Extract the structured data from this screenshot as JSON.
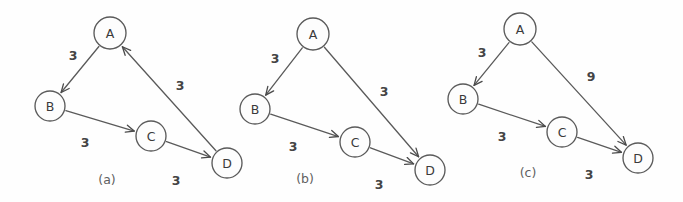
{
  "figure": {
    "width": 683,
    "height": 202,
    "background_color": "#fefefe",
    "stroke_color": "#5a5a5a",
    "text_color": "#3a3a3a"
  },
  "chart_data": {
    "type": "diagram",
    "title": "",
    "panels": [
      {
        "caption": "(a)",
        "caption_x": 107,
        "caption_y": 179,
        "nodes": [
          {
            "id": "A",
            "label": "A",
            "x": 110,
            "y": 33,
            "r": 16
          },
          {
            "id": "B",
            "label": "B",
            "x": 50,
            "y": 106,
            "r": 15
          },
          {
            "id": "C",
            "label": "C",
            "x": 151,
            "y": 136,
            "r": 15
          },
          {
            "id": "D",
            "label": "D",
            "x": 227,
            "y": 163,
            "r": 15
          }
        ],
        "edges": [
          {
            "from": "A",
            "to": "B",
            "weight": "3",
            "label_x": 73,
            "label_y": 55
          },
          {
            "from": "D",
            "to": "A",
            "weight": "3",
            "label_x": 180,
            "label_y": 85
          },
          {
            "from": "B",
            "to": "C",
            "weight": "3",
            "label_x": 85,
            "label_y": 142
          },
          {
            "from": "C",
            "to": "D",
            "weight": "3",
            "label_x": 176,
            "label_y": 180
          }
        ]
      },
      {
        "caption": "(b)",
        "caption_x": 305,
        "caption_y": 178,
        "nodes": [
          {
            "id": "A",
            "label": "A",
            "x": 313,
            "y": 34,
            "r": 16
          },
          {
            "id": "B",
            "label": "B",
            "x": 255,
            "y": 109,
            "r": 15
          },
          {
            "id": "C",
            "label": "C",
            "x": 355,
            "y": 142,
            "r": 15
          },
          {
            "id": "D",
            "label": "D",
            "x": 430,
            "y": 170,
            "r": 15
          }
        ],
        "edges": [
          {
            "from": "A",
            "to": "B",
            "weight": "3",
            "label_x": 275,
            "label_y": 58
          },
          {
            "from": "A",
            "to": "D",
            "weight": "3",
            "label_x": 384,
            "label_y": 91
          },
          {
            "from": "B",
            "to": "C",
            "weight": "3",
            "label_x": 293,
            "label_y": 146
          },
          {
            "from": "C",
            "to": "D",
            "weight": "3",
            "label_x": 379,
            "label_y": 184
          }
        ]
      },
      {
        "caption": "(c)",
        "caption_x": 528,
        "caption_y": 172,
        "nodes": [
          {
            "id": "A",
            "label": "A",
            "x": 520,
            "y": 29,
            "r": 16
          },
          {
            "id": "B",
            "label": "B",
            "x": 463,
            "y": 99,
            "r": 15
          },
          {
            "id": "C",
            "label": "C",
            "x": 562,
            "y": 132,
            "r": 15
          },
          {
            "id": "D",
            "label": "D",
            "x": 638,
            "y": 158,
            "r": 15
          }
        ],
        "edges": [
          {
            "from": "A",
            "to": "B",
            "weight": "3",
            "label_x": 482,
            "label_y": 52
          },
          {
            "from": "A",
            "to": "D",
            "weight": "9",
            "label_x": 591,
            "label_y": 76
          },
          {
            "from": "B",
            "to": "C",
            "weight": "3",
            "label_x": 502,
            "label_y": 136
          },
          {
            "from": "C",
            "to": "D",
            "weight": "3",
            "label_x": 589,
            "label_y": 174
          }
        ]
      }
    ]
  }
}
